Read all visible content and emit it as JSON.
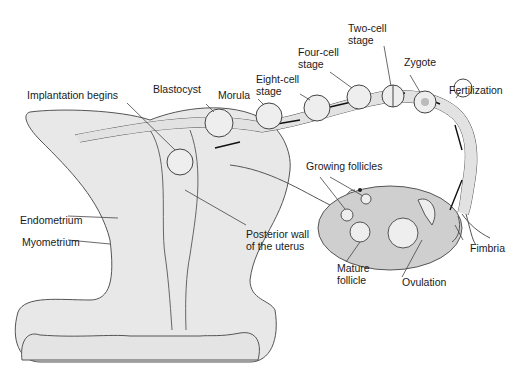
{
  "diagram": {
    "title": "",
    "labels": {
      "implantation": "Implantation begins",
      "blastocyst": "Blastocyst",
      "morula": "Morula",
      "eight_cell": "Eight-cell\nstage",
      "four_cell": "Four-cell\nstage",
      "two_cell": "Two-cell\nstage",
      "zygote": "Zygote",
      "fertilization": "Fertilization",
      "growing_follicles": "Growing follicles",
      "endometrium": "Endometrium",
      "myometrium": "Myometrium",
      "posterior_wall": "Posterior wall\nof the uterus",
      "fimbria": "Fimbria",
      "mature_follicle": "Mature\nfollicle",
      "ovulation": "Ovulation"
    },
    "colors": {
      "tissue_fill": "#e6e6e6",
      "ovary_fill": "#cfcfcf",
      "stroke": "#444444",
      "text": "#1a1a1a"
    }
  }
}
